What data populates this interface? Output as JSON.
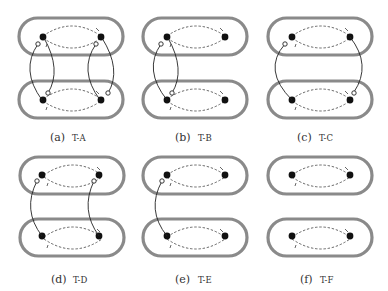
{
  "figure": {
    "panels": [
      {
        "id": "a",
        "label": "(a)",
        "name": "T-A",
        "links": [
          "left",
          "right"
        ],
        "port_top_left": true,
        "port_top_right": true,
        "port_bottom_left": true,
        "port_bottom_right": true
      },
      {
        "id": "b",
        "label": "(b)",
        "name": "T-B",
        "links": [
          "left"
        ],
        "port_top_left": true,
        "port_bottom_left": true
      },
      {
        "id": "c",
        "label": "(c)",
        "name": "T-C",
        "links": [
          "outer"
        ],
        "port_top_left": true,
        "port_bottom_right": true
      },
      {
        "id": "d",
        "label": "(d)",
        "name": "T-D",
        "links": [
          "left-down",
          "right-down"
        ],
        "port_top_left": true,
        "port_top_right": true
      },
      {
        "id": "e",
        "label": "(e)",
        "name": "T-E",
        "links": [
          "left-down"
        ],
        "port_top_left": true
      },
      {
        "id": "f",
        "label": "(f)",
        "name": "T-F",
        "links": []
      }
    ],
    "legend": {
      "pill": "rounded container (grey thick outline)",
      "node": "filled black dot",
      "port": "open circle",
      "dashed_arc": "dashed arc with arrow tick",
      "link": "solid curve between containers"
    }
  }
}
